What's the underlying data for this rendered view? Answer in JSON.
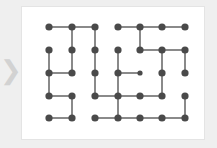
{
  "page": {
    "background_color": "#efefef",
    "card_background": "#ffffff",
    "card_border_color": "#e4e4e4"
  },
  "nav": {
    "prev_arrow_glyph": "❯",
    "prev_arrow_color": "#d2d2d2"
  },
  "graph": {
    "node_color": "#4a4a4a",
    "edge_color": "#8a8a8a",
    "node_radius": 3.6,
    "small_node_radius": 2.6,
    "rows": 5,
    "cols": 7,
    "col_x": [
      27,
      50,
      73,
      96,
      118,
      140,
      163
    ],
    "row_y": [
      20,
      43,
      66,
      89,
      111
    ],
    "small_nodes": [
      [
        2,
        4
      ]
    ],
    "h_edges": [
      [
        0,
        0,
        1
      ],
      [
        0,
        1,
        2
      ],
      [
        0,
        3,
        4
      ],
      [
        0,
        4,
        5
      ],
      [
        0,
        5,
        6
      ],
      [
        1,
        4,
        5
      ],
      [
        1,
        5,
        6
      ],
      [
        2,
        0,
        1
      ],
      [
        2,
        3,
        4
      ],
      [
        3,
        0,
        1
      ],
      [
        3,
        2,
        3
      ],
      [
        3,
        3,
        4
      ],
      [
        3,
        4,
        5
      ],
      [
        4,
        0,
        1
      ],
      [
        4,
        2,
        3
      ],
      [
        4,
        3,
        4
      ],
      [
        4,
        4,
        5
      ],
      [
        4,
        5,
        6
      ]
    ],
    "v_edges": [
      [
        1,
        0,
        1
      ],
      [
        2,
        0,
        1
      ],
      [
        4,
        0,
        1
      ],
      [
        0,
        1,
        2
      ],
      [
        1,
        1,
        2
      ],
      [
        2,
        1,
        2
      ],
      [
        3,
        1,
        2
      ],
      [
        5,
        1,
        2
      ],
      [
        6,
        1,
        2
      ],
      [
        0,
        2,
        3
      ],
      [
        2,
        2,
        3
      ],
      [
        3,
        2,
        3
      ],
      [
        5,
        2,
        3
      ],
      [
        1,
        3,
        4
      ],
      [
        3,
        3,
        4
      ],
      [
        6,
        3,
        4
      ]
    ]
  }
}
